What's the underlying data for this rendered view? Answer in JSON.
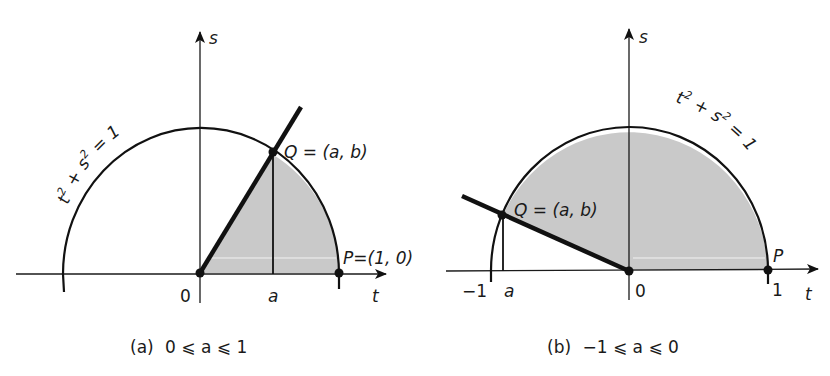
{
  "figure": {
    "panel_a": {
      "caption_letter": "(a)",
      "caption_condition": "0 ⩽ a ⩽ 1",
      "axis_vertical_label": "s",
      "axis_horizontal_label": "t",
      "origin_label": "0",
      "a_label": "a",
      "equation": {
        "t": "t",
        "t_exp": "2",
        "plus": " + ",
        "s": "s",
        "s_exp": "2",
        "rhs": " = 1"
      },
      "point_q_label": "Q = (a, b)",
      "point_p_label": "P=(1, 0)"
    },
    "panel_b": {
      "caption_letter": "(b)",
      "caption_condition": "−1 ⩽ a ⩽ 0",
      "axis_vertical_label": "s",
      "axis_horizontal_label": "t",
      "origin_label": "0",
      "a_label": "a",
      "minus_one_label": "−1",
      "one_label": "1",
      "equation": {
        "t": "t",
        "t_exp": "2",
        "plus": " + ",
        "s": "s",
        "s_exp": "2",
        "rhs": " = 1"
      },
      "point_q_label": "Q = (a, b)",
      "point_p_label": "P"
    }
  },
  "colors": {
    "shade": "#c9c9c9",
    "ink": "#111111"
  }
}
